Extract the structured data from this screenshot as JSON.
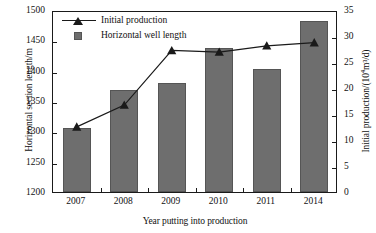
{
  "chart_data": {
    "type": "bar",
    "title": "",
    "categories": [
      "2007",
      "2008",
      "2009",
      "2010",
      "2011",
      "2014"
    ],
    "xlabel": "Year putting into production",
    "grid": false,
    "legend_position": "top-left",
    "axes": {
      "left": {
        "label": "Horizontal section length/m",
        "ticks": [
          1200,
          1250,
          1300,
          1350,
          1400,
          1450,
          1500
        ],
        "ylim": [
          1200,
          1500
        ]
      },
      "right": {
        "label_prefix": "Initial production/(10",
        "label_sup": "4",
        "label_suffix": "m³/d)",
        "label": "Initial production/(10⁴m³/d)",
        "ticks": [
          0,
          5,
          10,
          15,
          20,
          25,
          30,
          35
        ],
        "ylim": [
          0,
          35
        ]
      }
    },
    "series": [
      {
        "name": "Horizontal well length",
        "type": "bar",
        "axis": "left",
        "color": "#6e6e6e",
        "values": [
          1306,
          1368,
          1380,
          1438,
          1402,
          1482
        ]
      },
      {
        "name": "Initial production",
        "type": "line",
        "axis": "right",
        "color": "#1a1a1a",
        "marker": "triangle",
        "values": [
          12.9,
          17.1,
          27.6,
          27.3,
          28.5,
          29.1
        ]
      }
    ]
  },
  "legend": {
    "items": [
      {
        "label": "Initial production",
        "key": "line-triangle-marker"
      },
      {
        "label": "Horizontal well length",
        "key": "gray-square-swatch"
      }
    ]
  }
}
